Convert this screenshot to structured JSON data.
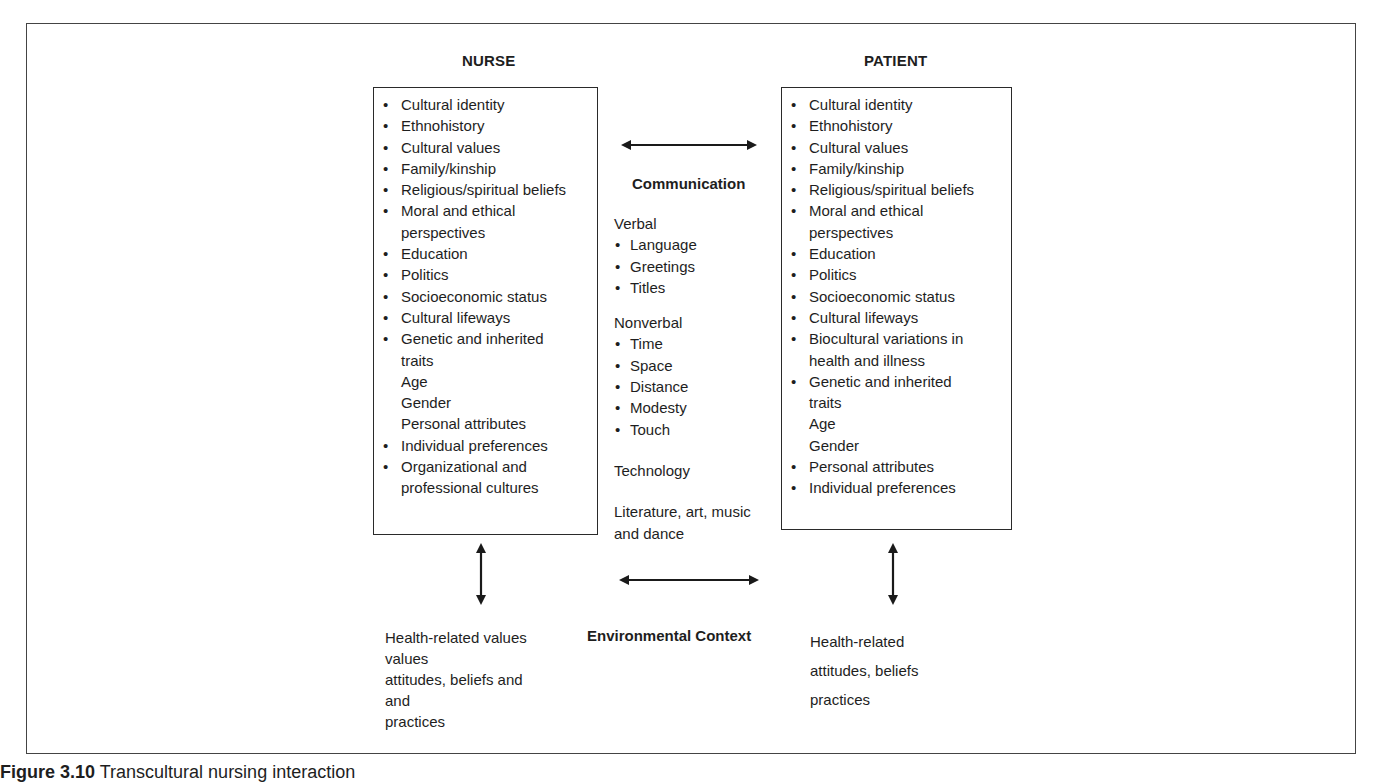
{
  "figure": {
    "nurse": {
      "heading": "NURSE",
      "items": [
        {
          "text": "Cultural identity",
          "bullet": true
        },
        {
          "text": "Ethnohistory",
          "bullet": true
        },
        {
          "text": "Cultural values",
          "bullet": true
        },
        {
          "text": "Family/kinship",
          "bullet": true
        },
        {
          "text": "Religious/spiritual beliefs",
          "bullet": true
        },
        {
          "text": "Moral and ethical",
          "bullet": true
        },
        {
          "text": "perspectives",
          "bullet": false
        },
        {
          "text": "Education",
          "bullet": true
        },
        {
          "text": "Politics",
          "bullet": true
        },
        {
          "text": "Socioeconomic status",
          "bullet": true
        },
        {
          "text": "Cultural lifeways",
          "bullet": true
        },
        {
          "text": "Genetic and inherited",
          "bullet": true
        },
        {
          "text": "traits",
          "bullet": false
        },
        {
          "text": "Age",
          "bullet": false
        },
        {
          "text": "Gender",
          "bullet": false
        },
        {
          "text": "Personal attributes",
          "bullet": false
        },
        {
          "text": "Individual preferences",
          "bullet": true
        },
        {
          "text": "Organizational and",
          "bullet": true
        },
        {
          "text": "professional cultures",
          "bullet": false
        }
      ],
      "health_lines": [
        "Health-related values",
        "values",
        "attitudes, beliefs and",
        "and",
        "practices"
      ]
    },
    "patient": {
      "heading": "PATIENT",
      "items": [
        {
          "text": "Cultural identity",
          "bullet": true
        },
        {
          "text": "Ethnohistory",
          "bullet": true
        },
        {
          "text": "Cultural values",
          "bullet": true
        },
        {
          "text": "Family/kinship",
          "bullet": true
        },
        {
          "text": "Religious/spiritual beliefs",
          "bullet": true
        },
        {
          "text": "Moral and ethical",
          "bullet": true
        },
        {
          "text": "perspectives",
          "bullet": false
        },
        {
          "text": "Education",
          "bullet": true
        },
        {
          "text": "Politics",
          "bullet": true
        },
        {
          "text": "Socioeconomic status",
          "bullet": true
        },
        {
          "text": "Cultural lifeways",
          "bullet": true
        },
        {
          "text": "Biocultural variations in",
          "bullet": true
        },
        {
          "text": "health and illness",
          "bullet": false
        },
        {
          "text": "Genetic and inherited",
          "bullet": true
        },
        {
          "text": "traits",
          "bullet": false
        },
        {
          "text": "Age",
          "bullet": false
        },
        {
          "text": "Gender",
          "bullet": false
        },
        {
          "text": "Personal attributes",
          "bullet": true
        },
        {
          "text": "Individual preferences",
          "bullet": true
        }
      ],
      "health_lines": [
        "Health-related",
        "attitudes, beliefs",
        "practices"
      ]
    },
    "communication": {
      "heading": "Communication",
      "verbal_label": "Verbal",
      "verbal_items": [
        "Language",
        "Greetings",
        "Titles"
      ],
      "nonverbal_label": "Nonverbal",
      "nonverbal_items": [
        "Time",
        "Space",
        "Distance",
        "Modesty",
        "Touch"
      ],
      "technology": "Technology",
      "literature_line1": "Literature, art, music",
      "literature_line2": "and dance"
    },
    "environment": {
      "heading": "Environmental Context"
    },
    "caption": {
      "label": "Figure 3.10",
      "text": "Transcultural nursing interaction"
    }
  }
}
